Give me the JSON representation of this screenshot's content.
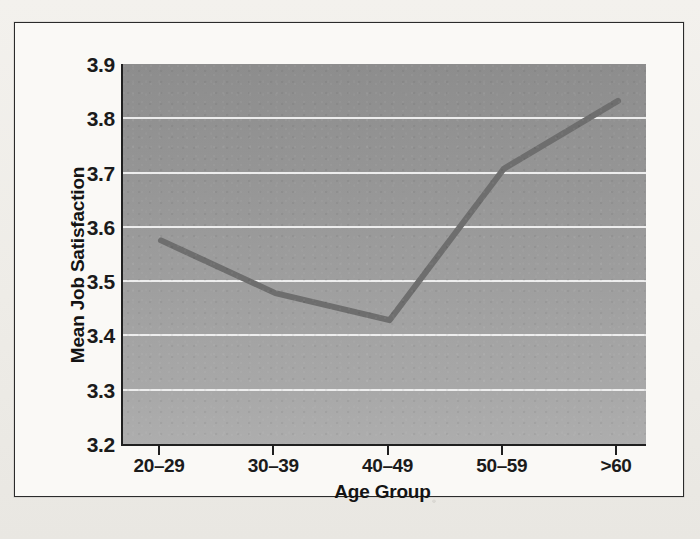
{
  "chart_data": {
    "type": "line",
    "title": "",
    "xlabel": "Age Group",
    "ylabel": "Mean Job Satisfaction",
    "categories": [
      "20–29",
      "30–39",
      "40–49",
      "50–59",
      ">60"
    ],
    "values": [
      3.575,
      3.478,
      3.428,
      3.707,
      3.832
    ],
    "series": [
      {
        "name": "Mean Job Satisfaction",
        "values": [
          3.575,
          3.478,
          3.428,
          3.707,
          3.832
        ]
      }
    ],
    "ylim": [
      3.2,
      3.9
    ],
    "yticks": [
      3.2,
      3.3,
      3.4,
      3.5,
      3.6,
      3.7,
      3.8,
      3.9
    ],
    "ytick_labels": [
      "3.2",
      "3.3",
      "3.4",
      "3.5",
      "3.6",
      "3.7",
      "3.8",
      "3.9"
    ],
    "gridlines": [
      3.3,
      3.4,
      3.5,
      3.6,
      3.7,
      3.8
    ],
    "grid": true,
    "legend": "none",
    "line_color": "#6e6e6e",
    "plot_background": "#9b9b9b",
    "gridline_color": "#f4f4f4",
    "axis_color": "#1f1f1f",
    "figure_background": "#faf9f6"
  },
  "figure": {
    "y_axis_title": "Mean Job Satisfaction",
    "x_axis_title": "Age Group",
    "y_tick_labels": [
      "3.9",
      "3.8",
      "3.7",
      "3.6",
      "3.5",
      "3.4",
      "3.3",
      "3.2"
    ],
    "x_tick_labels": [
      "20–29",
      "30–39",
      "40–49",
      "50–59",
      ">60"
    ]
  },
  "page": {
    "ghost_text_left": "",
    "ghost_text_bottom": ""
  }
}
